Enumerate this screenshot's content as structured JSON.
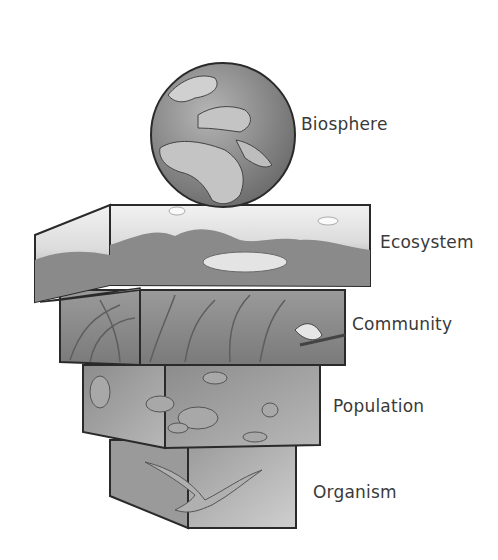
{
  "diagram": {
    "levels": [
      {
        "name": "Biosphere",
        "depiction": "globe showing Europe and Africa"
      },
      {
        "name": "Ecosystem",
        "depiction": "landscape with hills, lake and vegetation"
      },
      {
        "name": "Community",
        "depiction": "tall grasses with a small bird on a branch"
      },
      {
        "name": "Population",
        "depiction": "flock of flying ducks"
      },
      {
        "name": "Organism",
        "depiction": "single flying duck"
      }
    ]
  },
  "colors": {
    "background": "#ffffff",
    "outline": "#2a2a2a",
    "text": "#3a3a3a",
    "globe_ocean": "#8a8a8a",
    "globe_land": "#c8c8c8"
  }
}
